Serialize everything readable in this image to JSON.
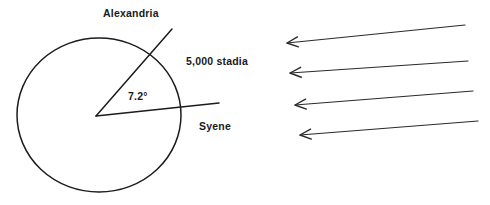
{
  "figure": {
    "background_color": "#ffffff",
    "ink_color": "#1c1c1c",
    "labels": {
      "alexandria": "Alexandria",
      "syene": "Syene",
      "distance": "5,000 stadia",
      "angle": "7.2°"
    },
    "earth": {
      "center_x": 99,
      "center_y": 115,
      "radius_x": 82,
      "radius_y": 77
    },
    "rays": [
      {
        "name": "ray-to-alexandria",
        "x1": 96,
        "y1": 116,
        "x2": 172,
        "y2": 29
      },
      {
        "name": "ray-to-syene",
        "x1": 96,
        "y1": 116,
        "x2": 219,
        "y2": 103
      }
    ],
    "sun_rays": [
      {
        "name": "sun-ray-1",
        "x1": 465,
        "y1": 25,
        "x2": 287,
        "y2": 43
      },
      {
        "name": "sun-ray-2",
        "x1": 468,
        "y1": 61,
        "x2": 290,
        "y2": 73
      },
      {
        "name": "sun-ray-3",
        "x1": 473,
        "y1": 91,
        "x2": 295,
        "y2": 105
      },
      {
        "name": "sun-ray-4",
        "x1": 478,
        "y1": 121,
        "x2": 300,
        "y2": 135
      }
    ],
    "sun_ray_count": 4,
    "label_positions": {
      "alexandria": {
        "x": 103,
        "y": 17
      },
      "distance": {
        "x": 186,
        "y": 65
      },
      "angle": {
        "x": 128,
        "y": 100
      },
      "syene": {
        "x": 199,
        "y": 130
      }
    }
  }
}
